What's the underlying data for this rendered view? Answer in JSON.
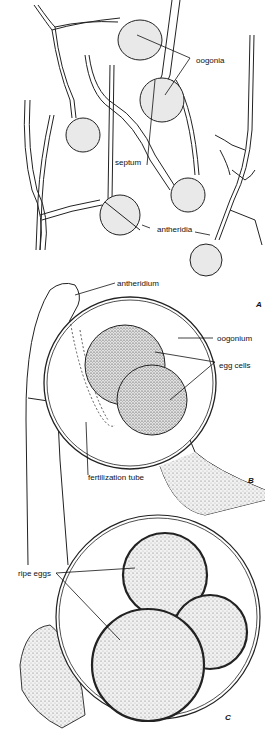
{
  "figure": {
    "panels": [
      {
        "id": "A",
        "label": "A",
        "labels": {
          "oogonia": "oogonia",
          "septum": "septum",
          "antheridia": "antheridia"
        }
      },
      {
        "id": "B",
        "label": "B",
        "labels": {
          "antheridium": "antheridium",
          "oogonium": "oogonium",
          "egg_cells": "egg cells",
          "fertilization_tube": "fertilization tube"
        }
      },
      {
        "id": "C",
        "label": "C",
        "labels": {
          "ripe_eggs": "ripe eggs"
        }
      }
    ]
  }
}
